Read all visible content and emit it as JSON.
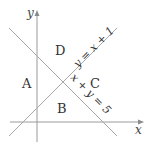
{
  "diagram": {
    "axes": {
      "x_label": "x",
      "y_label": "y"
    },
    "lines": [
      {
        "id": "line-y-eq-x-plus-1",
        "label": "y = x + 1",
        "slope": 1,
        "intercept": 1
      },
      {
        "id": "line-x-plus-y-eq-5",
        "label": "x + y = 5",
        "slope": -1,
        "intercept": 5
      }
    ],
    "regions": [
      {
        "label": "A",
        "position": "left"
      },
      {
        "label": "B",
        "position": "bottom"
      },
      {
        "label": "C",
        "position": "right"
      },
      {
        "label": "D",
        "position": "top"
      }
    ],
    "colors": {
      "lines": "#a8a8a8",
      "axes": "#9a9a9a",
      "text": "#333333"
    }
  }
}
